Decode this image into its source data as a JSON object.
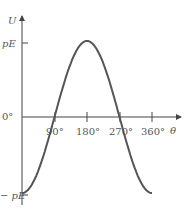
{
  "chart_data": {
    "type": "line",
    "title": "",
    "xlabel": "θ",
    "ylabel": "U",
    "x_ticks": [
      "90°",
      "180°",
      "270°",
      "360°"
    ],
    "y_ticks": [
      "pE",
      "0°",
      "− pE"
    ],
    "x": [
      0,
      45,
      90,
      135,
      180,
      225,
      270,
      315,
      360
    ],
    "series": [
      {
        "name": "U = −pE cos θ",
        "values": [
          -1,
          -0.707,
          0,
          0.707,
          1,
          0.707,
          0,
          -0.707,
          -1
        ]
      }
    ],
    "xlim": [
      0,
      360
    ],
    "ylim": [
      -1,
      1
    ],
    "grid": false,
    "colors": {
      "axis": "#444444",
      "curve": "#555555",
      "text": "#555555"
    }
  }
}
